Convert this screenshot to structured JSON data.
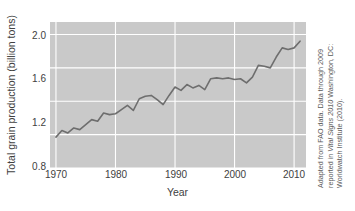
{
  "chart_data": {
    "type": "line",
    "title": "",
    "xlabel": "Year",
    "ylabel": "Total grain production (billion tons)",
    "xlim": [
      1969,
      2012
    ],
    "ylim": [
      0.8,
      2.55
    ],
    "grid": true,
    "legend": "none",
    "x_ticks": [
      "1970",
      "1980",
      "1990",
      "2000",
      "2010"
    ],
    "x_tick_values": [
      1970,
      1980,
      1990,
      2000,
      2010
    ],
    "y_ticks": [
      "0.8",
      "1.2",
      "1.6",
      "2.0",
      "2.4"
    ],
    "y_tick_values": [
      0.8,
      1.2,
      1.6,
      2.0,
      2.4
    ],
    "series": [
      {
        "name": "Total grain production",
        "units": "billion tons",
        "line_color": "#6e6e6e",
        "x": [
          1970,
          1971,
          1972,
          1973,
          1974,
          1975,
          1976,
          1977,
          1978,
          1979,
          1980,
          1981,
          1982,
          1983,
          1984,
          1985,
          1986,
          1987,
          1988,
          1989,
          1990,
          1991,
          1992,
          1993,
          1994,
          1995,
          1996,
          1997,
          1998,
          1999,
          2000,
          2001,
          2002,
          2003,
          2004,
          2005,
          2006,
          2007,
          2008,
          2009,
          2010,
          2011
        ],
        "values": [
          1.17,
          1.25,
          1.22,
          1.28,
          1.26,
          1.32,
          1.38,
          1.36,
          1.46,
          1.44,
          1.45,
          1.5,
          1.55,
          1.49,
          1.63,
          1.66,
          1.67,
          1.62,
          1.56,
          1.67,
          1.77,
          1.73,
          1.8,
          1.76,
          1.79,
          1.74,
          1.87,
          1.88,
          1.87,
          1.88,
          1.86,
          1.87,
          1.82,
          1.89,
          2.03,
          2.02,
          2.0,
          2.13,
          2.24,
          2.22,
          2.24,
          2.32
        ]
      }
    ],
    "plot_bg_color": "#c9c9c9",
    "grid_color": "#ffffff",
    "figure_bg_color": "#ffffff"
  },
  "caption": {
    "line1": "Adapted from FAO data. Data through 2009",
    "italic": "Vital Signs 2010",
    "line2_prefix": "reported in ",
    "line2_suffix": " Washington, DC:",
    "line3": "Worldwatch Institute (2010)."
  }
}
